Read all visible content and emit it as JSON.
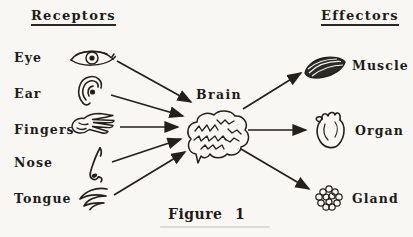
{
  "figure": {
    "caption": "Figure 1",
    "center": {
      "label": "Brain",
      "icon": "brain-icon"
    }
  },
  "receptors": {
    "header": "Receptors",
    "items": [
      {
        "label": "Eye",
        "icon": "eye-icon"
      },
      {
        "label": "Ear",
        "icon": "ear-icon"
      },
      {
        "label": "Fingers",
        "icon": "hand-icon"
      },
      {
        "label": "Nose",
        "icon": "nose-icon"
      },
      {
        "label": "Tongue",
        "icon": "tongue-icon"
      }
    ]
  },
  "effectors": {
    "header": "Effectors",
    "items": [
      {
        "label": "Muscle",
        "icon": "muscle-icon"
      },
      {
        "label": "Organ",
        "icon": "heart-icon"
      },
      {
        "label": "Gland",
        "icon": "gland-icon"
      }
    ]
  },
  "colors": {
    "ink": "#232019",
    "paper": "#f8f7f3"
  }
}
